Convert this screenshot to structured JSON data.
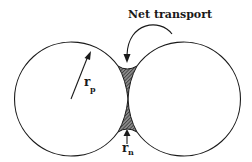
{
  "diagram": {
    "title": "Net transport",
    "particle_radius_label": {
      "symbol": "r",
      "subscript": "p"
    },
    "neck_radius_label": {
      "symbol": "r",
      "subscript": "n"
    },
    "colors": {
      "stroke": "#1a1a1a",
      "neck_fill": "#555555"
    }
  }
}
